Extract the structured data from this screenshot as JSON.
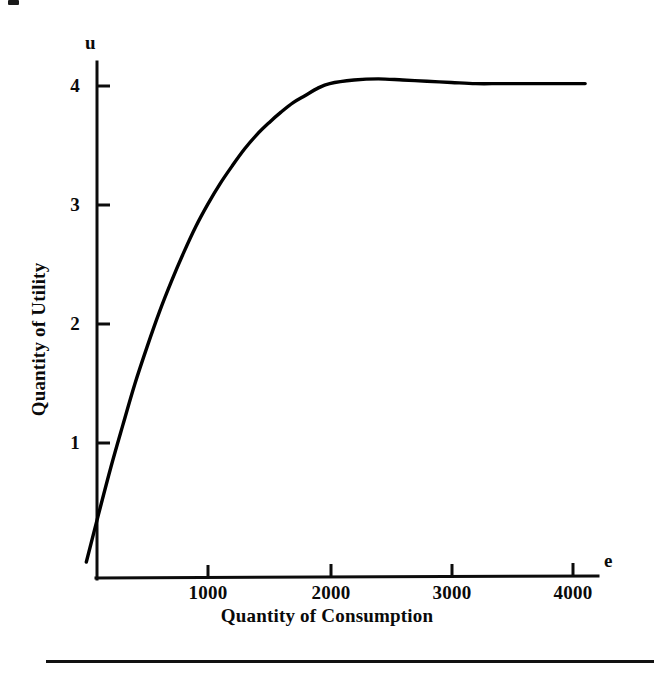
{
  "figure": {
    "axis_variable_y": "u",
    "axis_variable_x": "e",
    "axis_title_y": "Quantity of Utility",
    "axis_title_x": "Quantity of Consumption",
    "line_color": "#000000",
    "background_color": "#ffffff"
  },
  "chart_data": {
    "type": "line",
    "title": "",
    "subtitle": "",
    "xlabel": "Quantity of Consumption",
    "ylabel": "Quantity of Utility",
    "x_axis_symbol": "e",
    "y_axis_symbol": "u",
    "xlim": [
      0,
      4250
    ],
    "ylim": [
      0,
      4.35
    ],
    "xticks": [
      1000,
      2000,
      3000,
      4000
    ],
    "xtick_labels": [
      "1000",
      "2000",
      "3000",
      "4000"
    ],
    "yticks": [
      1,
      2,
      3,
      4
    ],
    "ytick_labels": [
      "1",
      "2",
      "3",
      "4"
    ],
    "grid": false,
    "legend": "none",
    "series": [
      {
        "name": "utility",
        "description": "concave increasing utility of consumption, saturating near u = 4",
        "x": [
          0,
          100,
          200,
          300,
          400,
          500,
          600,
          700,
          800,
          900,
          1000,
          1100,
          1200,
          1300,
          1400,
          1500,
          1600,
          1700,
          1800,
          1900,
          2000,
          2200,
          2400,
          2600,
          2800,
          3000,
          3200,
          3400,
          3600,
          3800,
          4000,
          4100
        ],
        "y": [
          0,
          0.4,
          0.79,
          1.15,
          1.5,
          1.81,
          2.1,
          2.36,
          2.6,
          2.82,
          3.01,
          3.18,
          3.33,
          3.47,
          3.59,
          3.69,
          3.78,
          3.86,
          3.92,
          3.98,
          4.02,
          4.05,
          4.06,
          4.05,
          4.04,
          4.03,
          4.02,
          4.02,
          4.02,
          4.02,
          4.02,
          4.02
        ]
      }
    ],
    "annotations": []
  },
  "ticks": {
    "y": [
      {
        "value": 4,
        "label": "4"
      },
      {
        "value": 3,
        "label": "3"
      },
      {
        "value": 2,
        "label": "2"
      },
      {
        "value": 1,
        "label": "1"
      }
    ],
    "x": [
      {
        "value": 1000,
        "label": "1000"
      },
      {
        "value": 2000,
        "label": "2000"
      },
      {
        "value": 3000,
        "label": "3000"
      },
      {
        "value": 4000,
        "label": "4000"
      }
    ]
  }
}
